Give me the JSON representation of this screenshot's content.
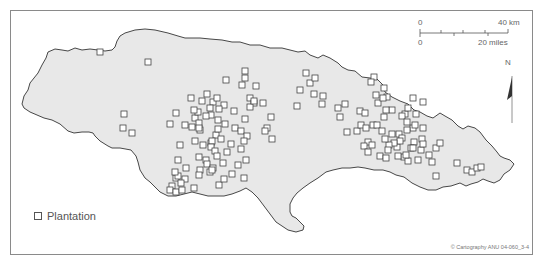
{
  "map": {
    "region": "Jamaica",
    "land_color": "#e8e8e8",
    "coast_color": "#333333",
    "marker_stroke": "#444444"
  },
  "legend": {
    "items": [
      {
        "symbol": "hollow-square",
        "label": "Plantation"
      }
    ]
  },
  "scale_bar": {
    "km_start": "0",
    "km_end": "40 km",
    "miles_start": "0",
    "miles_end": "20 miles"
  },
  "north_arrow": {
    "label": "N"
  },
  "credit": "© Cartography ANU 04-060_3-4",
  "plantations": [
    [
      100,
      52
    ],
    [
      148,
      62
    ],
    [
      124,
      114
    ],
    [
      123,
      128
    ],
    [
      132,
      133
    ],
    [
      176,
      113
    ],
    [
      170,
      124
    ],
    [
      180,
      145
    ],
    [
      178,
      160
    ],
    [
      186,
      168
    ],
    [
      176,
      178
    ],
    [
      172,
      186
    ],
    [
      170,
      190
    ],
    [
      176,
      192
    ],
    [
      182,
      190
    ],
    [
      185,
      179
    ],
    [
      178,
      176
    ],
    [
      181,
      183
    ],
    [
      175,
      172
    ],
    [
      194,
      188
    ],
    [
      210,
      172
    ],
    [
      245,
      71
    ],
    [
      245,
      78
    ],
    [
      242,
      85
    ],
    [
      256,
      86
    ],
    [
      226,
      80
    ],
    [
      207,
      94
    ],
    [
      250,
      98
    ],
    [
      254,
      103
    ],
    [
      250,
      107
    ],
    [
      235,
      128
    ],
    [
      271,
      117
    ],
    [
      195,
      118
    ],
    [
      185,
      125
    ],
    [
      198,
      112
    ],
    [
      199,
      123
    ],
    [
      192,
      127
    ],
    [
      200,
      130
    ],
    [
      195,
      141
    ],
    [
      203,
      145
    ],
    [
      211,
      143
    ],
    [
      216,
      135
    ],
    [
      212,
      141
    ],
    [
      211,
      147
    ],
    [
      215,
      151
    ],
    [
      217,
      156
    ],
    [
      199,
      157
    ],
    [
      206,
      160
    ],
    [
      207,
      164
    ],
    [
      200,
      170
    ],
    [
      213,
      168
    ],
    [
      199,
      175
    ],
    [
      212,
      170
    ],
    [
      223,
      163
    ],
    [
      219,
      185
    ],
    [
      194,
      110
    ],
    [
      191,
      98
    ],
    [
      202,
      101
    ],
    [
      213,
      102
    ],
    [
      217,
      98
    ],
    [
      211,
      115
    ],
    [
      224,
      105
    ],
    [
      234,
      111
    ],
    [
      245,
      119
    ],
    [
      241,
      131
    ],
    [
      247,
      136
    ],
    [
      231,
      144
    ],
    [
      244,
      141
    ],
    [
      241,
      149
    ],
    [
      246,
      160
    ],
    [
      238,
      165
    ],
    [
      232,
      174
    ],
    [
      244,
      178
    ],
    [
      218,
      120
    ],
    [
      225,
      124
    ],
    [
      221,
      139
    ],
    [
      227,
      152
    ],
    [
      224,
      179
    ],
    [
      206,
      116
    ],
    [
      199,
      128
    ],
    [
      219,
      109
    ],
    [
      218,
      129
    ],
    [
      210,
      108
    ],
    [
      254,
      101
    ],
    [
      263,
      103
    ],
    [
      267,
      128
    ],
    [
      265,
      131
    ],
    [
      272,
      139
    ],
    [
      297,
      106
    ],
    [
      300,
      90
    ],
    [
      310,
      83
    ],
    [
      306,
      73
    ],
    [
      315,
      78
    ],
    [
      314,
      94
    ],
    [
      323,
      96
    ],
    [
      322,
      104
    ],
    [
      345,
      104
    ],
    [
      338,
      108
    ],
    [
      340,
      117
    ],
    [
      347,
      132
    ],
    [
      357,
      131
    ],
    [
      360,
      111
    ],
    [
      365,
      113
    ],
    [
      361,
      125
    ],
    [
      366,
      128
    ],
    [
      373,
      125
    ],
    [
      368,
      142
    ],
    [
      364,
      146
    ],
    [
      368,
      152
    ],
    [
      380,
      156
    ],
    [
      386,
      158
    ],
    [
      397,
      147
    ],
    [
      413,
      128
    ],
    [
      407,
      130
    ],
    [
      423,
      128
    ],
    [
      415,
      125
    ],
    [
      422,
      139
    ],
    [
      436,
      148
    ],
    [
      457,
      163
    ],
    [
      467,
      170
    ],
    [
      472,
      172
    ],
    [
      477,
      168
    ],
    [
      481,
      167
    ],
    [
      421,
      150
    ],
    [
      429,
      155
    ],
    [
      436,
      176
    ],
    [
      392,
      110
    ],
    [
      384,
      117
    ],
    [
      392,
      134
    ],
    [
      405,
      114
    ],
    [
      416,
      114
    ],
    [
      402,
      116
    ],
    [
      407,
      122
    ],
    [
      399,
      134
    ],
    [
      402,
      138
    ],
    [
      414,
      142
    ],
    [
      423,
      144
    ],
    [
      440,
      143
    ],
    [
      418,
      160
    ],
    [
      432,
      162
    ],
    [
      411,
      148
    ],
    [
      400,
      141
    ],
    [
      394,
      143
    ],
    [
      389,
      145
    ],
    [
      404,
      157
    ],
    [
      408,
      161
    ],
    [
      413,
      148
    ],
    [
      398,
      156
    ],
    [
      406,
      155
    ],
    [
      388,
      150
    ],
    [
      377,
      125
    ],
    [
      382,
      131
    ],
    [
      385,
      139
    ],
    [
      372,
      145
    ],
    [
      384,
      88
    ],
    [
      376,
      95
    ],
    [
      378,
      103
    ],
    [
      386,
      110
    ],
    [
      387,
      97
    ],
    [
      374,
      77
    ],
    [
      371,
      82
    ],
    [
      383,
      98
    ],
    [
      408,
      108
    ],
    [
      413,
      98
    ],
    [
      423,
      102
    ]
  ]
}
